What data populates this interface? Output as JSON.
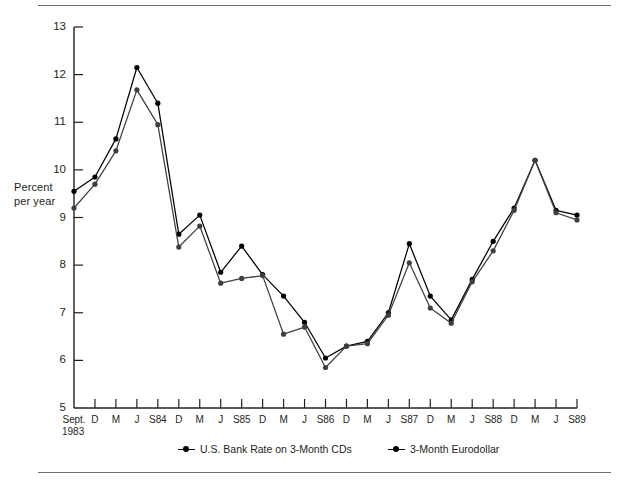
{
  "chart_data": {
    "type": "line",
    "title": "",
    "xlabel": "",
    "ylabel": "Percent\nper year",
    "ylabel_line1": "Percent",
    "ylabel_line2": "per year",
    "ylim": [
      5,
      13
    ],
    "ytick_values": [
      13,
      12,
      11,
      10,
      9,
      8,
      7,
      6,
      5
    ],
    "ytick_labels": [
      "13",
      "12",
      "11",
      "10",
      "9",
      "8",
      "7",
      "6",
      "5"
    ],
    "grid": false,
    "legend_position": "bottom",
    "origin_label_line1": "Sept.",
    "origin_label_line2": "1983",
    "categories": [
      "Sept. 1983",
      "D",
      "M",
      "J",
      "S84",
      "D",
      "M",
      "J",
      "S85",
      "D",
      "M",
      "J",
      "S86",
      "D",
      "M",
      "J",
      "S87",
      "D",
      "M",
      "J",
      "S88",
      "D",
      "M",
      "J",
      "S89"
    ],
    "xtick_labels": [
      "Sept.",
      "D",
      "M",
      "J",
      "S84",
      "D",
      "M",
      "J",
      "S85",
      "D",
      "M",
      "J",
      "S86",
      "D",
      "M",
      "J",
      "S87",
      "D",
      "M",
      "J",
      "S88",
      "D",
      "M",
      "J",
      "S89"
    ],
    "series": [
      {
        "name": "U.S. Bank Rate on 3-Month CDs",
        "color": "#000000",
        "marker": "circle",
        "values": [
          9.55,
          9.85,
          10.65,
          12.15,
          11.4,
          8.65,
          9.05,
          7.85,
          8.4,
          7.8,
          7.35,
          6.8,
          6.05,
          6.3,
          6.4,
          7.0,
          8.45,
          7.35,
          6.85,
          7.7,
          8.5,
          9.2,
          10.2,
          9.15,
          9.05
        ]
      },
      {
        "name": "3-Month Eurodollar",
        "color": "#3f3f3f",
        "marker": "circle",
        "values": [
          9.2,
          9.7,
          10.4,
          11.68,
          10.95,
          8.38,
          8.82,
          7.62,
          7.72,
          7.78,
          6.55,
          6.7,
          5.85,
          6.3,
          6.35,
          6.95,
          8.05,
          7.1,
          6.78,
          7.65,
          8.3,
          9.15,
          10.2,
          9.1,
          8.95
        ]
      }
    ]
  },
  "legend": {
    "items": [
      {
        "label": "U.S. Bank Rate on 3-Month CDs"
      },
      {
        "label": "3-Month Eurodollar"
      }
    ]
  }
}
